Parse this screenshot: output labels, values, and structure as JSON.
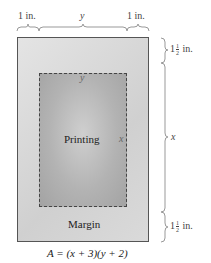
{
  "diagram": {
    "top_labels": {
      "left_margin": "1 in.",
      "width_var": "y",
      "right_margin": "1 in."
    },
    "right_labels": {
      "top_margin_whole": "1",
      "top_margin_num": "1",
      "top_margin_den": "2",
      "top_margin_unit": "in.",
      "height_var": "x",
      "bottom_margin_whole": "1",
      "bottom_margin_num": "1",
      "bottom_margin_den": "2",
      "bottom_margin_unit": "in."
    },
    "inner": {
      "top_label": "y",
      "center_label": "Printing",
      "side_label": "x"
    },
    "margin_label": "Margin",
    "formula": "A = (x + 3)(y + 2)",
    "colors": {
      "outer_fill": "#d9d9d9",
      "inner_fill": "#b5b5b5",
      "border": "#555555",
      "brace": "#999999"
    }
  }
}
